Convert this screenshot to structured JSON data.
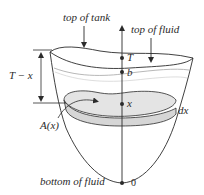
{
  "labels": {
    "top_of_tank": "top of tank",
    "top_of_fluid": "top of fluid",
    "T": "T",
    "b": "b",
    "x": "x",
    "dx": "dx",
    "T_minus_x": "T − x",
    "A_of_x": "A(x)",
    "bottom_of_fluid": "bottom of fluid",
    "zero": "0"
  },
  "colors": {
    "stroke": "#2b2b2b",
    "fluid_line": "#b8b8b8",
    "slab_fill": "#d6d6d6",
    "slab_top_fill": "#e4e4e4"
  }
}
